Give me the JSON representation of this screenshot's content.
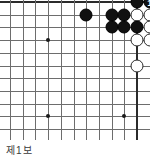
{
  "diagram": {
    "kind": "go-board-diagram",
    "caption": "제1보",
    "board": {
      "cols": 11,
      "rows": 11,
      "origin_x": 10,
      "origin_y": 2,
      "spacing": 12.7,
      "edges": {
        "top": true,
        "right": true,
        "left": false,
        "bottom": false
      },
      "grid_color": "#6d6d6d",
      "edge_color": "#2b2b2b",
      "background": "#ffffff"
    },
    "star_points": [
      {
        "col": 3,
        "row": 3
      },
      {
        "col": 3,
        "row": 9
      },
      {
        "col": 9,
        "row": 9
      }
    ],
    "stones": [
      {
        "col": 6,
        "row": 1,
        "color": "black",
        "label": ""
      },
      {
        "col": 8,
        "row": 1,
        "color": "black",
        "label": ""
      },
      {
        "col": 9,
        "row": 1,
        "color": "black",
        "label": ""
      },
      {
        "col": 10,
        "row": 0,
        "color": "black",
        "label": ""
      },
      {
        "col": 11,
        "row": 0,
        "color": "black",
        "label": "1"
      },
      {
        "col": 12,
        "row": 0,
        "color": "white",
        "label": "2"
      },
      {
        "col": 10,
        "row": 1,
        "color": "white",
        "label": ""
      },
      {
        "col": 11,
        "row": 1,
        "color": "white",
        "label": ""
      },
      {
        "col": 12,
        "row": 1,
        "color": "black",
        "label": "3"
      },
      {
        "col": 8,
        "row": 2,
        "color": "black",
        "label": ""
      },
      {
        "col": 9,
        "row": 2,
        "color": "black",
        "label": ""
      },
      {
        "col": 10,
        "row": 2,
        "color": "black",
        "label": ""
      },
      {
        "col": 11,
        "row": 2,
        "color": "white",
        "label": ""
      },
      {
        "col": 10,
        "row": 3,
        "color": "white",
        "label": ""
      },
      {
        "col": 11,
        "row": 3,
        "color": "white",
        "label": ""
      },
      {
        "col": 10,
        "row": 5,
        "color": "white",
        "label": ""
      }
    ],
    "move_numbers": [
      {
        "number": "1",
        "color": "black"
      },
      {
        "number": "2",
        "color": "white"
      },
      {
        "number": "3",
        "color": "black"
      }
    ]
  }
}
